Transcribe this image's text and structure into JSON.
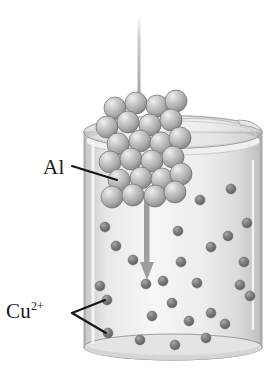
{
  "figure": {
    "type": "diagram",
    "background_color": "#ffffff"
  },
  "labels": {
    "aluminum": {
      "text": "Al",
      "name": "aluminum-label"
    },
    "copper_ion": {
      "base": "Cu",
      "superscript": "2+",
      "name": "copper-ion-label"
    }
  },
  "colors": {
    "glass_light": "#f2f2f2",
    "glass_mid": "#d8d8d8",
    "glass_dark": "#b4b4b4",
    "solution": "#ededed",
    "al_sphere_light": "#e2e2e2",
    "al_sphere_mid": "#b9b9b9",
    "al_sphere_dark": "#8c8c8c",
    "cu_sphere_light": "#9a9a9a",
    "cu_sphere_dark": "#5f5f5f",
    "arrow": "#9a9a9a",
    "leader_line": "#1a1a1a",
    "wire": "#a8a8a8"
  },
  "beaker": {
    "name": "beaker",
    "left": 84,
    "right": 262,
    "rim_y": 132,
    "bottom_y": 358,
    "rim_ellipse_ry": 16,
    "base_ellipse_ry": 12,
    "has_pour_spout": true,
    "spout_side": "right",
    "fill_level_y": 140
  },
  "wire": {
    "name": "support-wire",
    "x": 139,
    "top_y": 14,
    "bottom_y": 103,
    "width": 3
  },
  "arrow": {
    "name": "downward-motion-arrow",
    "x": 147,
    "top_y": 200,
    "bottom_y": 278,
    "head_width": 13,
    "head_height": 16
  },
  "aluminum_cluster": {
    "name": "aluminum-metal-cluster",
    "sphere_radius": 11,
    "spheres": [
      {
        "cx": 115,
        "cy": 108
      },
      {
        "cx": 136,
        "cy": 103
      },
      {
        "cx": 157,
        "cy": 106
      },
      {
        "cx": 176,
        "cy": 101
      },
      {
        "cx": 107,
        "cy": 127
      },
      {
        "cx": 128,
        "cy": 122
      },
      {
        "cx": 150,
        "cy": 125
      },
      {
        "cx": 171,
        "cy": 120
      },
      {
        "cx": 118,
        "cy": 144
      },
      {
        "cx": 140,
        "cy": 141
      },
      {
        "cx": 161,
        "cy": 143
      },
      {
        "cx": 180,
        "cy": 138
      },
      {
        "cx": 110,
        "cy": 162
      },
      {
        "cx": 131,
        "cy": 159
      },
      {
        "cx": 152,
        "cy": 161
      },
      {
        "cx": 173,
        "cy": 157
      },
      {
        "cx": 119,
        "cy": 180
      },
      {
        "cx": 141,
        "cy": 178
      },
      {
        "cx": 162,
        "cy": 179
      },
      {
        "cx": 181,
        "cy": 174
      },
      {
        "cx": 112,
        "cy": 197
      },
      {
        "cx": 133,
        "cy": 195
      },
      {
        "cx": 155,
        "cy": 196
      },
      {
        "cx": 175,
        "cy": 192
      }
    ]
  },
  "copper_ions": {
    "name": "copper-ion-spheres",
    "sphere_radius": 5,
    "spheres": [
      {
        "cx": 105,
        "cy": 227
      },
      {
        "cx": 116,
        "cy": 246
      },
      {
        "cx": 200,
        "cy": 200
      },
      {
        "cx": 231,
        "cy": 189
      },
      {
        "cx": 247,
        "cy": 223
      },
      {
        "cx": 178,
        "cy": 231
      },
      {
        "cx": 211,
        "cy": 247
      },
      {
        "cx": 181,
        "cy": 262
      },
      {
        "cx": 228,
        "cy": 236
      },
      {
        "cx": 100,
        "cy": 286
      },
      {
        "cx": 107,
        "cy": 300
      },
      {
        "cx": 108,
        "cy": 333
      },
      {
        "cx": 146,
        "cy": 284
      },
      {
        "cx": 163,
        "cy": 281
      },
      {
        "cx": 197,
        "cy": 283
      },
      {
        "cx": 240,
        "cy": 285
      },
      {
        "cx": 152,
        "cy": 316
      },
      {
        "cx": 172,
        "cy": 303
      },
      {
        "cx": 189,
        "cy": 321
      },
      {
        "cx": 211,
        "cy": 313
      },
      {
        "cx": 225,
        "cy": 324
      },
      {
        "cx": 250,
        "cy": 296
      },
      {
        "cx": 140,
        "cy": 340
      },
      {
        "cx": 175,
        "cy": 345
      },
      {
        "cx": 206,
        "cy": 338
      },
      {
        "cx": 244,
        "cy": 262
      },
      {
        "cx": 133,
        "cy": 260
      }
    ]
  },
  "leaders": {
    "aluminum": {
      "name": "aluminum-leader-line",
      "x1": 72,
      "y1": 166,
      "x2": 117,
      "y2": 180
    },
    "copper": {
      "name": "copper-leader-lines",
      "vertex_x": 72,
      "vertex_y": 313,
      "targets": [
        {
          "x": 105,
          "y": 300
        },
        {
          "x": 106,
          "y": 333
        }
      ]
    }
  }
}
